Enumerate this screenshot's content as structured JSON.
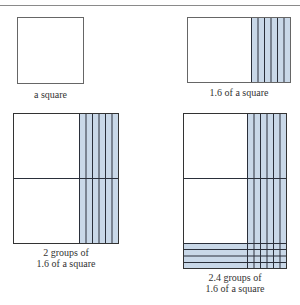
{
  "figure": {
    "panels": [
      {
        "id": "square",
        "caption_lines": [
          "a square"
        ]
      },
      {
        "id": "one-point-six",
        "caption_lines": [
          "1.6 of a square"
        ]
      },
      {
        "id": "two-groups",
        "caption_lines": [
          "2 groups of",
          "1.6 of a square"
        ]
      },
      {
        "id": "two-point-four-groups",
        "caption_lines": [
          "2.4 groups of",
          "1.6 of a square"
        ]
      }
    ],
    "colors": {
      "shade": "#c9d8e8",
      "line": "#2a2f3a",
      "border": "#555555"
    }
  }
}
